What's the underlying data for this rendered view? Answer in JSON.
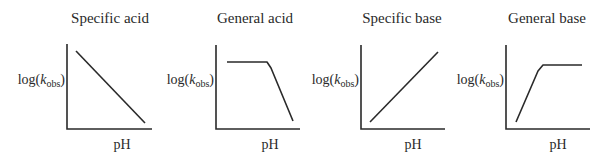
{
  "figure": {
    "panels": [
      {
        "title": "Specific acid",
        "ylabel": {
          "prefix": "log(",
          "k": "k",
          "sub": "obs",
          "suffix": ")"
        },
        "xlabel": "pH",
        "shape": "linear-decreasing"
      },
      {
        "title": "General acid",
        "ylabel": {
          "prefix": "log(",
          "k": "k",
          "sub": "obs",
          "suffix": ")"
        },
        "xlabel": "pH",
        "shape": "plateau-then-decreasing"
      },
      {
        "title": "Specific base",
        "ylabel": {
          "prefix": "log(",
          "k": "k",
          "sub": "obs",
          "suffix": ")"
        },
        "xlabel": "pH",
        "shape": "linear-increasing"
      },
      {
        "title": "General base",
        "ylabel": {
          "prefix": "log(",
          "k": "k",
          "sub": "obs",
          "suffix": ")"
        },
        "xlabel": "pH",
        "shape": "increasing-then-plateau"
      }
    ],
    "colors": {
      "ink": "#2a2a2a",
      "background": "#ffffff"
    }
  }
}
